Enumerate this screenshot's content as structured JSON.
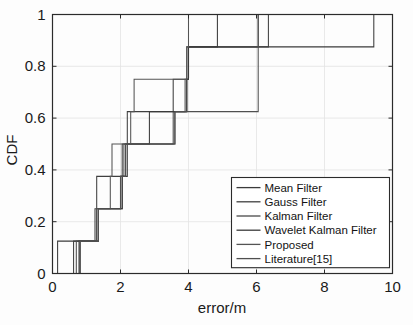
{
  "figure": {
    "caption_partial": "",
    "background": "#fdfdfd"
  },
  "chart_data": {
    "type": "line",
    "title": "",
    "xlabel": "error/m",
    "ylabel": "CDF",
    "xlim": [
      0,
      10
    ],
    "ylim": [
      0,
      1
    ],
    "xticks": [
      0,
      2,
      4,
      6,
      8,
      10
    ],
    "xtick_labels": [
      "0",
      "2",
      "4",
      "6",
      "8",
      "10"
    ],
    "yticks": [
      0,
      0.2,
      0.4,
      0.6,
      0.8,
      1
    ],
    "ytick_labels": [
      "0",
      "0.2",
      "0.4",
      "0.6",
      "0.8",
      "1"
    ],
    "grid": true,
    "step_style": "post",
    "legend_position": "lower right",
    "series": [
      {
        "name": "Mean Filter",
        "color": "#3b3b3b",
        "x": [
          0.15,
          0.15,
          1.35,
          2.05,
          2.2,
          3.6,
          3.95,
          4.0,
          9.45,
          9.45
        ],
        "y": [
          0.0,
          0.125,
          0.25,
          0.375,
          0.5,
          0.625,
          0.75,
          0.875,
          0.875,
          1.0
        ]
      },
      {
        "name": "Gauss Filter",
        "color": "#3f3f3f",
        "x": [
          0.62,
          0.62,
          1.25,
          1.3,
          2.05,
          2.2,
          3.55,
          3.95,
          6.35,
          6.35
        ],
        "y": [
          0.0,
          0.125,
          0.25,
          0.375,
          0.5,
          0.625,
          0.75,
          0.875,
          0.875,
          1.0
        ]
      },
      {
        "name": "Kalman Filter",
        "color": "#4a4a4a",
        "x": [
          0.7,
          0.7,
          1.3,
          2.0,
          2.1,
          3.55,
          3.9,
          4.0,
          6.05,
          6.05
        ],
        "y": [
          0.0,
          0.125,
          0.25,
          0.375,
          0.5,
          0.625,
          0.75,
          0.875,
          0.875,
          1.0
        ]
      },
      {
        "name": "Wavelet Kalman Filter",
        "color": "#3a3a3a",
        "x": [
          0.78,
          0.78,
          1.35,
          2.05,
          2.15,
          2.85,
          3.95,
          4.0,
          4.85,
          4.85
        ],
        "y": [
          0.0,
          0.125,
          0.25,
          0.375,
          0.5,
          0.625,
          0.75,
          0.875,
          0.875,
          1.0
        ]
      },
      {
        "name": "Proposed",
        "color": "#545454",
        "x": [
          0.82,
          0.82,
          1.35,
          1.7,
          1.75,
          2.3,
          2.4,
          3.95,
          4.0,
          4.0
        ],
        "y": [
          0.0,
          0.125,
          0.25,
          0.375,
          0.5,
          0.625,
          0.75,
          0.875,
          0.875,
          1.0
        ]
      },
      {
        "name": "Literature[15]",
        "color": "#4f4f4f",
        "x": [
          0.8,
          0.8,
          1.3,
          2.0,
          2.15,
          3.6,
          5.1,
          6.05,
          6.05,
          6.05
        ],
        "y": [
          0.0,
          0.125,
          0.25,
          0.375,
          0.5,
          0.625,
          0.625,
          0.75,
          0.875,
          1.0
        ]
      }
    ],
    "legend_entries": [
      "Mean Filter",
      "Gauss Filter",
      "Kalman Filter",
      "Wavelet Kalman Filter",
      "Proposed",
      "Literature[15]"
    ]
  }
}
